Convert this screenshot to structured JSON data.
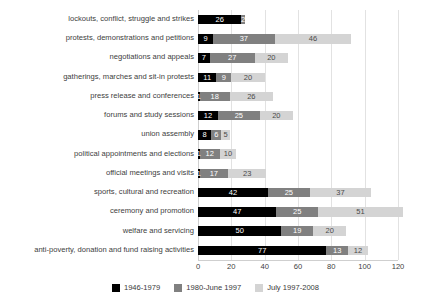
{
  "chart_data": {
    "type": "bar",
    "orientation": "horizontal",
    "stacked": true,
    "title": "",
    "xlabel": "",
    "ylabel": "",
    "xlim": [
      0,
      120
    ],
    "xticks": [
      "0",
      "20",
      "40",
      "60",
      "80",
      "100",
      "120"
    ],
    "grid": true,
    "legend_position": "bottom-center",
    "categories": [
      "lockouts, conflict, struggle and strikes",
      "protests, demonstrations and petitions",
      "negotiations and appeals",
      "gatherings, marches and sit-in protests",
      "press release and conferences",
      "forums and study sessions",
      "union assembly",
      "political appointments and elections",
      "official meetings and visits",
      "sports, cultural and recreation",
      "ceremony and promotion",
      "welfare and servicing",
      "anti-poverty, donation and fund raising activities"
    ],
    "series": [
      {
        "name": "1946-1979",
        "color": "#000000",
        "values": [
          26,
          9,
          7,
          11,
          1,
          12,
          8,
          1,
          1,
          42,
          47,
          50,
          77
        ]
      },
      {
        "name": "1980-June 1997",
        "color": "#808080",
        "values": [
          2,
          37,
          27,
          9,
          18,
          25,
          6,
          12,
          17,
          25,
          25,
          19,
          13
        ]
      },
      {
        "name": "July 1997-2008",
        "color": "#d4d4d4",
        "values": [
          0,
          46,
          20,
          20,
          26,
          20,
          5,
          10,
          23,
          37,
          51,
          20,
          12
        ]
      }
    ],
    "bar_labels": [
      [
        "26",
        "2",
        ""
      ],
      [
        "9",
        "37",
        "46"
      ],
      [
        "7",
        "27",
        "20"
      ],
      [
        "11",
        "9",
        "20"
      ],
      [
        "1",
        "18",
        "26"
      ],
      [
        "12",
        "25",
        "20"
      ],
      [
        "8",
        "6",
        "5"
      ],
      [
        "1",
        "12",
        "10"
      ],
      [
        "1",
        "17",
        "23"
      ],
      [
        "42",
        "25",
        "37"
      ],
      [
        "47",
        "25",
        "51"
      ],
      [
        "50",
        "19",
        "20"
      ],
      [
        "77",
        "13",
        "12"
      ]
    ]
  }
}
